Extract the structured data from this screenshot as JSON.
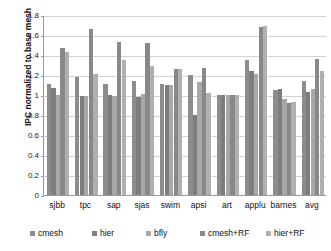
{
  "chart_data": {
    "type": "bar",
    "title": "",
    "xlabel": "",
    "ylabel": "IPC normalized to base mesh",
    "ylim": [
      0,
      1.8
    ],
    "ytick_step": 0.2,
    "yticks": [
      "1.8",
      "1.6",
      "1.4",
      "1.2",
      "1",
      "0.8",
      "0.6",
      "0.4",
      "0.2",
      "0"
    ],
    "grid": true,
    "legend_position": "bottom",
    "categories": [
      "sjbb",
      "tpc",
      "sap",
      "sjas",
      "swim",
      "apsi",
      "art",
      "applu",
      "barnes",
      "avg"
    ],
    "series": [
      {
        "name": "cmesh",
        "color": "#8c8c8c",
        "values": [
          1.11,
          1.18,
          1.11,
          1.14,
          1.11,
          1.2,
          1.0,
          1.35,
          1.05,
          1.14
        ]
      },
      {
        "name": "hier",
        "color": "#7d7d7d",
        "values": [
          1.07,
          0.99,
          1.0,
          0.98,
          1.1,
          0.8,
          1.0,
          1.24,
          1.06,
          1.03
        ]
      },
      {
        "name": "bfly",
        "color": "#a8a8a8",
        "values": [
          1.0,
          0.99,
          0.99,
          1.01,
          1.1,
          1.13,
          1.0,
          1.21,
          0.96,
          1.06
        ]
      },
      {
        "name": "cmesh+RF",
        "color": "#888888",
        "values": [
          1.47,
          1.66,
          1.53,
          1.52,
          1.26,
          1.27,
          1.0,
          1.68,
          0.92,
          1.36
        ]
      },
      {
        "name": "hier+RF",
        "color": "#b0b0b0",
        "values": [
          1.43,
          1.21,
          1.35,
          1.29,
          1.26,
          1.02,
          1.0,
          1.69,
          0.93,
          1.24
        ]
      }
    ]
  }
}
